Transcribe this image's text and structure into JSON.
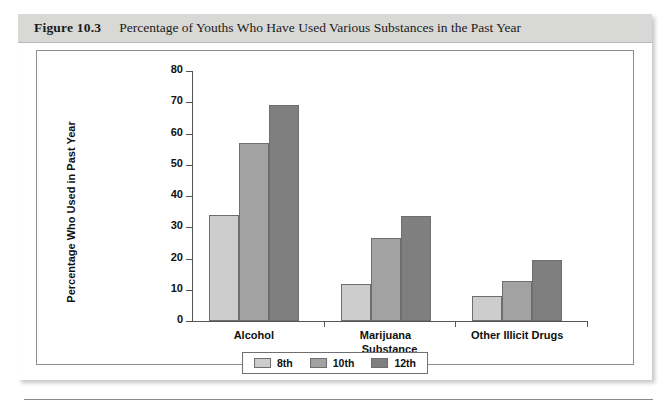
{
  "figure": {
    "number": "Figure 10.3",
    "title": "Percentage of Youths Who Have Used Various Substances in the Past Year"
  },
  "chart_data": {
    "type": "bar",
    "title": "Percentage of Youths Who Have Used Various Substances in the Past Year",
    "xlabel": "Substance",
    "ylabel": "Percentage Who Used in Past Year",
    "categories": [
      "Alcohol",
      "Marijuana",
      "Other Illicit Drugs"
    ],
    "series": [
      {
        "name": "8th",
        "color": "#cdcdcd",
        "values": [
          34,
          12,
          8
        ]
      },
      {
        "name": "10th",
        "color": "#a2a2a2",
        "values": [
          57,
          26.5,
          12.7
        ]
      },
      {
        "name": "12th",
        "color": "#7f7f7f",
        "values": [
          69,
          33.5,
          19.5
        ]
      }
    ],
    "ylim": [
      0,
      80
    ],
    "yticks": [
      0,
      10,
      20,
      30,
      40,
      50,
      60,
      70,
      80
    ],
    "grid": false,
    "legend_position": "bottom-center"
  }
}
